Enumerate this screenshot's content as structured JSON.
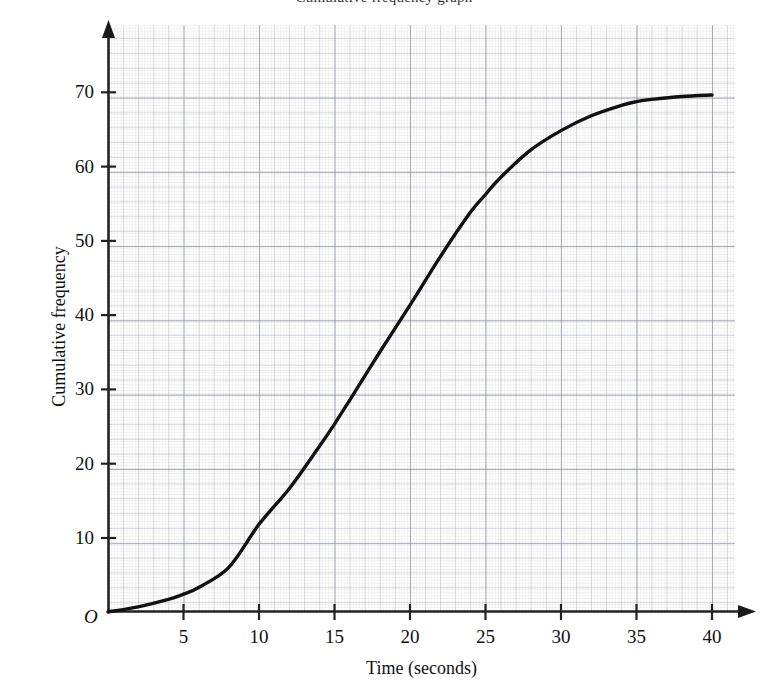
{
  "chart_data": {
    "type": "line",
    "title": "Cumulative frequency graph",
    "xlabel": "Time (seconds)",
    "ylabel": "Cumulative frequency",
    "xlim": [
      0,
      41.5
    ],
    "ylim": [
      0,
      79
    ],
    "grid": true,
    "grid_style": "graph-paper",
    "legend": "none",
    "origin_marker": "O",
    "xticks": [
      5,
      10,
      15,
      20,
      25,
      30,
      35,
      40
    ],
    "xtick_labels": [
      "5",
      "10",
      "15",
      "20",
      "25",
      "30",
      "35",
      "40"
    ],
    "yticks": [
      10,
      20,
      30,
      40,
      50,
      60,
      70
    ],
    "ytick_labels": [
      "10",
      "20",
      "30",
      "40",
      "50",
      "60",
      "70"
    ],
    "x": [
      0,
      2,
      4,
      5,
      6,
      8,
      10,
      12,
      14,
      15,
      16,
      18,
      20,
      22,
      24,
      25,
      26,
      28,
      30,
      32,
      34,
      35,
      36,
      38,
      40
    ],
    "y": [
      0,
      0.7,
      1.7,
      2.4,
      3.3,
      6.0,
      11.8,
      16.6,
      22.3,
      25.3,
      28.5,
      35.0,
      41.3,
      47.8,
      53.8,
      56.2,
      58.5,
      62.2,
      64.8,
      66.8,
      68.2,
      68.7,
      69.0,
      69.4,
      69.6
    ],
    "series": [
      {
        "name": "Cumulative frequency",
        "color": "#111111",
        "line_width": 3,
        "points": [
          {
            "x": 0,
            "y": 0
          },
          {
            "x": 5,
            "y": 2.4
          },
          {
            "x": 10,
            "y": 11.8
          },
          {
            "x": 15,
            "y": 25.3
          },
          {
            "x": 20,
            "y": 41.3
          },
          {
            "x": 25,
            "y": 56.2
          },
          {
            "x": 30,
            "y": 64.8
          },
          {
            "x": 35,
            "y": 68.7
          },
          {
            "x": 40,
            "y": 69.6
          }
        ]
      }
    ]
  },
  "axis": {
    "x_title": "Time (seconds)",
    "y_title": "Cumulative frequency",
    "origin": "O"
  },
  "colors": {
    "curve": "#111111",
    "axis": "#222222",
    "grid_major": "#787d8c",
    "grid_minor": "#969baa",
    "background": "#ffffff"
  }
}
